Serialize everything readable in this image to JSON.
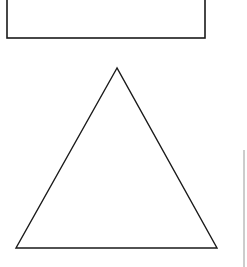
{
  "canvas": {
    "width": 247,
    "height": 267,
    "background": "#ffffff"
  },
  "shapes": {
    "rectangle": {
      "x1": 7,
      "y1": -2,
      "x2": 205,
      "y2": 38,
      "stroke": "#1a1a1a",
      "stroke_width": 1.6
    },
    "triangle": {
      "apex": [
        117,
        68
      ],
      "base_left": [
        16,
        248
      ],
      "base_right": [
        217,
        248
      ],
      "stroke": "#1a1a1a",
      "stroke_width": 1.4
    },
    "edge_line": {
      "x": 244,
      "y1": 150,
      "y2": 267,
      "stroke": "#9a9a9a"
    }
  }
}
